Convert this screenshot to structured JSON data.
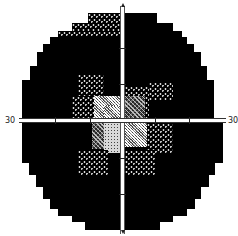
{
  "chart_data": {
    "type": "heatmap",
    "xlabel": "",
    "ylabel": "",
    "axis_labels": {
      "left": "30",
      "right": "30"
    },
    "xlim": [
      -30,
      30
    ],
    "ylim": [
      -30,
      30
    ],
    "tick_spacing_deg": 10,
    "shade_scale": {
      "0": "black (absolute defect)",
      "1": "sparse dots on black",
      "2": "dense dither (dark gray)",
      "3": "checkered mid gray",
      "4": "light stipple (near white)"
    },
    "grid_columns_deg": [
      -27,
      -21,
      -15,
      -9,
      -3,
      3,
      9,
      15,
      21,
      27
    ],
    "grid_rows_deg": [
      27,
      21,
      15,
      9,
      3,
      -3,
      -9,
      -15,
      -21,
      -27
    ],
    "rows": [
      {
        "y": 27,
        "shades": [
          null,
          null,
          null,
          1,
          1,
          0,
          0,
          null,
          null,
          null
        ]
      },
      {
        "y": 21,
        "shades": [
          null,
          1,
          1,
          1,
          1,
          0,
          0,
          0,
          0,
          null
        ]
      },
      {
        "y": 15,
        "shades": [
          0,
          0,
          0,
          0,
          0,
          0,
          0,
          0,
          0,
          0
        ]
      },
      {
        "y": 9,
        "shades": [
          0,
          0,
          0,
          1,
          1,
          0,
          1,
          1,
          0,
          0
        ]
      },
      {
        "y": 3,
        "shades": [
          0,
          0,
          1,
          3,
          3,
          2,
          2,
          0,
          0,
          0
        ]
      },
      {
        "y": -3,
        "shades": [
          0,
          0,
          0,
          2,
          4,
          3,
          2,
          1,
          0,
          0
        ]
      },
      {
        "y": -9,
        "shades": [
          0,
          0,
          0,
          1,
          1,
          1,
          1,
          0,
          0,
          0
        ]
      },
      {
        "y": -15,
        "shades": [
          0,
          0,
          0,
          0,
          0,
          0,
          0,
          0,
          0,
          0
        ]
      },
      {
        "y": -21,
        "shades": [
          null,
          0,
          0,
          0,
          0,
          0,
          0,
          0,
          0,
          null
        ]
      },
      {
        "y": -27,
        "shades": [
          null,
          null,
          null,
          0,
          0,
          0,
          0,
          null,
          null,
          null
        ]
      }
    ]
  },
  "labels": {
    "left_axis": "30",
    "right_axis": "30"
  },
  "cells": [
    {
      "x": 88,
      "y": 13,
      "w": 32,
      "h": 10,
      "s": "s1"
    },
    {
      "x": 125,
      "y": 13,
      "w": 32,
      "h": 10,
      "s": "s0"
    },
    {
      "x": 72,
      "y": 23,
      "w": 48,
      "h": 8,
      "s": "s1"
    },
    {
      "x": 125,
      "y": 23,
      "w": 48,
      "h": 8,
      "s": "s0"
    },
    {
      "x": 58,
      "y": 31,
      "w": 62,
      "h": 6,
      "s": "s1"
    },
    {
      "x": 125,
      "y": 31,
      "w": 57,
      "h": 6,
      "s": "s0"
    },
    {
      "x": 50,
      "y": 37,
      "w": 70,
      "h": 7,
      "s": "s0"
    },
    {
      "x": 125,
      "y": 37,
      "w": 62,
      "h": 7,
      "s": "s0"
    },
    {
      "x": 43,
      "y": 44,
      "w": 77,
      "h": 8,
      "s": "s0"
    },
    {
      "x": 125,
      "y": 44,
      "w": 69,
      "h": 8,
      "s": "s0"
    },
    {
      "x": 37,
      "y": 52,
      "w": 83,
      "h": 14,
      "s": "s0"
    },
    {
      "x": 125,
      "y": 52,
      "w": 76,
      "h": 14,
      "s": "s0"
    },
    {
      "x": 30,
      "y": 66,
      "w": 90,
      "h": 14,
      "s": "s0"
    },
    {
      "x": 125,
      "y": 66,
      "w": 82,
      "h": 14,
      "s": "s0"
    },
    {
      "x": 22,
      "y": 80,
      "w": 98,
      "h": 38,
      "s": "s0"
    },
    {
      "x": 125,
      "y": 80,
      "w": 89,
      "h": 38,
      "s": "s0"
    },
    {
      "x": 22,
      "y": 123,
      "w": 98,
      "h": 40,
      "s": "s0"
    },
    {
      "x": 125,
      "y": 123,
      "w": 98,
      "h": 40,
      "s": "s0"
    },
    {
      "x": 29,
      "y": 163,
      "w": 91,
      "h": 12,
      "s": "s0"
    },
    {
      "x": 125,
      "y": 163,
      "w": 90,
      "h": 12,
      "s": "s0"
    },
    {
      "x": 36,
      "y": 175,
      "w": 84,
      "h": 12,
      "s": "s0"
    },
    {
      "x": 125,
      "y": 175,
      "w": 84,
      "h": 12,
      "s": "s0"
    },
    {
      "x": 43,
      "y": 187,
      "w": 77,
      "h": 12,
      "s": "s0"
    },
    {
      "x": 125,
      "y": 187,
      "w": 76,
      "h": 12,
      "s": "s0"
    },
    {
      "x": 50,
      "y": 199,
      "w": 70,
      "h": 10,
      "s": "s0"
    },
    {
      "x": 125,
      "y": 199,
      "w": 70,
      "h": 10,
      "s": "s0"
    },
    {
      "x": 58,
      "y": 209,
      "w": 62,
      "h": 7,
      "s": "s0"
    },
    {
      "x": 125,
      "y": 209,
      "w": 62,
      "h": 7,
      "s": "s0"
    },
    {
      "x": 72,
      "y": 216,
      "w": 48,
      "h": 6,
      "s": "s0"
    },
    {
      "x": 125,
      "y": 216,
      "w": 48,
      "h": 6,
      "s": "s0"
    },
    {
      "x": 85,
      "y": 222,
      "w": 35,
      "h": 8,
      "s": "s0"
    },
    {
      "x": 125,
      "y": 222,
      "w": 35,
      "h": 8,
      "s": "s0"
    },
    {
      "x": 78,
      "y": 74,
      "w": 26,
      "h": 22,
      "s": "s1"
    },
    {
      "x": 72,
      "y": 96,
      "w": 22,
      "h": 22,
      "s": "s1"
    },
    {
      "x": 94,
      "y": 96,
      "w": 26,
      "h": 22,
      "s": "s3"
    },
    {
      "x": 104,
      "y": 106,
      "w": 16,
      "h": 12,
      "s": "s3"
    },
    {
      "x": 125,
      "y": 86,
      "w": 24,
      "h": 32,
      "s": "s1"
    },
    {
      "x": 125,
      "y": 96,
      "w": 20,
      "h": 22,
      "s": "s2"
    },
    {
      "x": 149,
      "y": 82,
      "w": 24,
      "h": 18,
      "s": "s1"
    },
    {
      "x": 92,
      "y": 123,
      "w": 12,
      "h": 26,
      "s": "s2"
    },
    {
      "x": 104,
      "y": 123,
      "w": 16,
      "h": 30,
      "s": "s4"
    },
    {
      "x": 125,
      "y": 123,
      "w": 22,
      "h": 24,
      "s": "s3"
    },
    {
      "x": 147,
      "y": 123,
      "w": 26,
      "h": 30,
      "s": "s1"
    },
    {
      "x": 78,
      "y": 150,
      "w": 30,
      "h": 26,
      "s": "s1"
    },
    {
      "x": 125,
      "y": 150,
      "w": 30,
      "h": 26,
      "s": "s1"
    }
  ],
  "ticks_h": [
    55,
    90,
    155,
    189
  ],
  "ticks_v": [
    48,
    84,
    158,
    194
  ]
}
